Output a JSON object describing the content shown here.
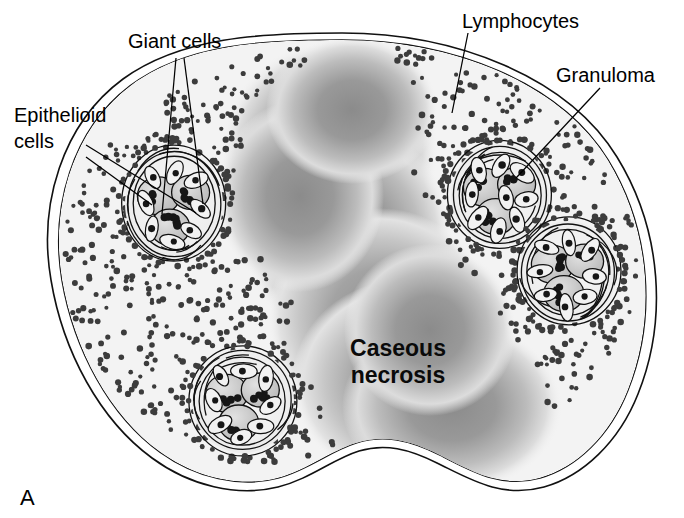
{
  "figure": {
    "panel_letter": "A",
    "alt_summary": "Schematic cross-section of a tuberculous granulomatous lesion showing central caseous necrosis surrounded by lymphocytes and four granulomas containing giant cells and epithelioid cells.",
    "background_color": "#ffffff"
  },
  "labels": [
    {
      "id": "epithelioid-cells",
      "text_line1": "Epithelioid",
      "text_line2": "cells",
      "full_text": "Epithelioid cells",
      "x": 14,
      "y": 118,
      "leader_count": 2
    },
    {
      "id": "giant-cells",
      "text_line1": "Giant cells",
      "text_line2": "",
      "full_text": "Giant cells",
      "x": 128,
      "y": 48,
      "leader_count": 2
    },
    {
      "id": "lymphocytes",
      "text_line1": "Lymphocytes",
      "text_line2": "",
      "full_text": "Lymphocytes",
      "x": 462,
      "y": 24,
      "leader_count": 1
    },
    {
      "id": "granuloma",
      "text_line1": "Granuloma",
      "text_line2": "",
      "full_text": "Granuloma",
      "x": 556,
      "y": 78,
      "leader_count": 1
    }
  ],
  "central_label": {
    "id": "caseous-necrosis",
    "line1": "Caseous",
    "line2": "necrosis",
    "full_text": "Caseous necrosis",
    "x": 398,
    "y": 356,
    "bold": true
  },
  "colors": {
    "outline": "#111111",
    "tissue_fill": "#f3f3f3",
    "necrosis_core": "#8d8d8d",
    "necrosis_mid": "#b4b4b4",
    "necrosis_edge": "#ececec",
    "lymphocyte_dot": "#3c3c3c",
    "giant_cell_fill": "#cfcfcf",
    "epithelioid_fill": "#f2f2f2",
    "nucleus": "#161616",
    "label_text": "#000000"
  },
  "structures": {
    "mass": {
      "name": "granulomatous-tissue-mass",
      "shape": "kidney-bean with bottom notch",
      "double_outline": true
    },
    "granulomas": [
      {
        "id": "granuloma-upper-left",
        "cx": 174,
        "cy": 204,
        "rx": 52,
        "ry": 58,
        "giant_cells": 3,
        "epithelioid_cells": 8
      },
      {
        "id": "granuloma-upper-right",
        "cx": 500,
        "cy": 195,
        "rx": 52,
        "ry": 54,
        "giant_cells": 3,
        "epithelioid_cells": 9
      },
      {
        "id": "granuloma-mid-right",
        "cx": 568,
        "cy": 272,
        "rx": 52,
        "ry": 54,
        "giant_cells": 3,
        "epithelioid_cells": 8
      },
      {
        "id": "granuloma-bottom-left",
        "cx": 243,
        "cy": 401,
        "rx": 54,
        "ry": 55,
        "giant_cells": 3,
        "epithelioid_cells": 8
      }
    ],
    "lymphocyte_field": {
      "name": "lymphocyte-stipple-field",
      "approx_dot_count": 640,
      "dot_radius_px": 2.6
    }
  }
}
